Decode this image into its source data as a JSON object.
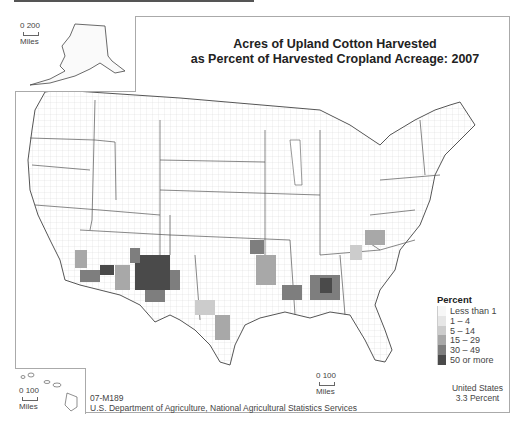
{
  "title": {
    "line1": "Acres of Upland Cotton Harvested",
    "line2": "as Percent of Harvested Cropland Acreage: 2007"
  },
  "insets": {
    "alaska": {
      "scale_label": "0 200",
      "units": "Miles"
    },
    "hawaii": {
      "scale_label": "0 100",
      "units": "Miles"
    }
  },
  "main_scale": {
    "scale_label": "0 100",
    "units": "Miles"
  },
  "legend": {
    "title": "Percent",
    "items": [
      {
        "label": "Less than 1",
        "color": "#f7f7f7"
      },
      {
        "label": "1 – 4",
        "color": "#e6e6e6"
      },
      {
        "label": "5 – 14",
        "color": "#cccccc"
      },
      {
        "label": "15 – 29",
        "color": "#a8a8a8"
      },
      {
        "label": "30 – 49",
        "color": "#7e7e7e"
      },
      {
        "label": "50 or more",
        "color": "#4a4a4a"
      }
    ]
  },
  "footer": {
    "map_id": "07-M189",
    "source": "U.S. Department of Agriculture, National Agricultural Statistics Services"
  },
  "total": {
    "label": "United States",
    "value": "3.3 Percent"
  },
  "colors": {
    "state_border": "#555555",
    "county_border": "#bbbbbb",
    "frame": "#aaaaaa"
  }
}
